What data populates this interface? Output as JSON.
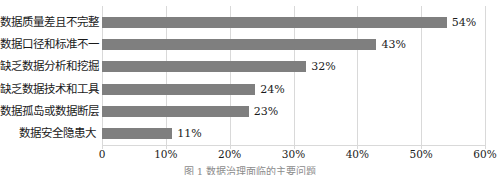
{
  "chart_data": {
    "type": "bar",
    "orientation": "horizontal",
    "title": "",
    "xlabel": "",
    "ylabel": "",
    "categories": [
      "数据质量差且不完整",
      "数据口径和标准不一",
      "缺乏数据分析和挖掘",
      "缺乏数据技术和工具",
      "数据孤岛或数据断层",
      "数据安全隐患大"
    ],
    "values": [
      54,
      43,
      32,
      24,
      23,
      11
    ],
    "value_labels": [
      "54%",
      "43%",
      "32%",
      "24%",
      "23%",
      "11%"
    ],
    "xlim": [
      0,
      60
    ],
    "xticks": [
      0,
      10,
      20,
      30,
      40,
      50,
      60
    ],
    "xtick_labels": [
      "0",
      "10%",
      "20%",
      "30%",
      "40%",
      "50%",
      "60%"
    ],
    "grid": "vertical",
    "legend": "none",
    "bar_color": "#7f7f7f",
    "gridline_color": "#d9d9d9",
    "text_color": "#1a1a1a"
  },
  "figure": {
    "top_clipped_text": "",
    "caption": "图 1  数据治理面临的主要问题"
  }
}
